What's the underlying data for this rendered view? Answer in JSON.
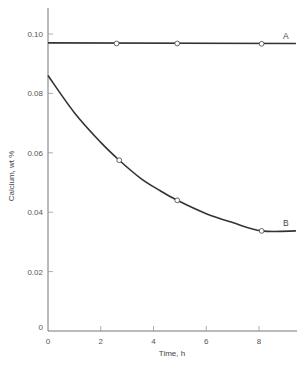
{
  "chart_data": {
    "type": "line",
    "title": "",
    "xlabel": "Time, h",
    "ylabel": "Calcium, wt %",
    "xlim": [
      0,
      9.4
    ],
    "ylim": [
      0,
      0.108
    ],
    "x_ticks": [
      0,
      2,
      4,
      6,
      8
    ],
    "x_tick_labels": [
      "0",
      "2",
      "4",
      "6",
      "8"
    ],
    "y_ticks": [
      0,
      0.02,
      0.04,
      0.06,
      0.08,
      0.1
    ],
    "y_tick_labels": [
      "0",
      "0.02",
      "0.04",
      "0.06",
      "0.08",
      "0.10"
    ],
    "grid": false,
    "legend": "inline labels at right end of each curve",
    "series": [
      {
        "name": "A",
        "curve": [
          [
            0,
            0.097
          ],
          [
            9.4,
            0.0968
          ]
        ],
        "markers": [
          [
            2.6,
            0.0968
          ],
          [
            4.9,
            0.0968
          ],
          [
            8.1,
            0.0967
          ]
        ],
        "marker_style": "open-circle"
      },
      {
        "name": "B",
        "curve": [
          [
            0,
            0.086
          ],
          [
            1,
            0.0735
          ],
          [
            2,
            0.0635
          ],
          [
            2.7,
            0.0575
          ],
          [
            3.5,
            0.0515
          ],
          [
            4.2,
            0.0475
          ],
          [
            4.9,
            0.044
          ],
          [
            6,
            0.0395
          ],
          [
            7,
            0.0365
          ],
          [
            8.1,
            0.0337
          ],
          [
            9.4,
            0.0337
          ]
        ],
        "markers": [
          [
            2.7,
            0.0575
          ],
          [
            4.9,
            0.044
          ],
          [
            8.1,
            0.0337
          ]
        ],
        "marker_style": "open-circle"
      }
    ]
  }
}
